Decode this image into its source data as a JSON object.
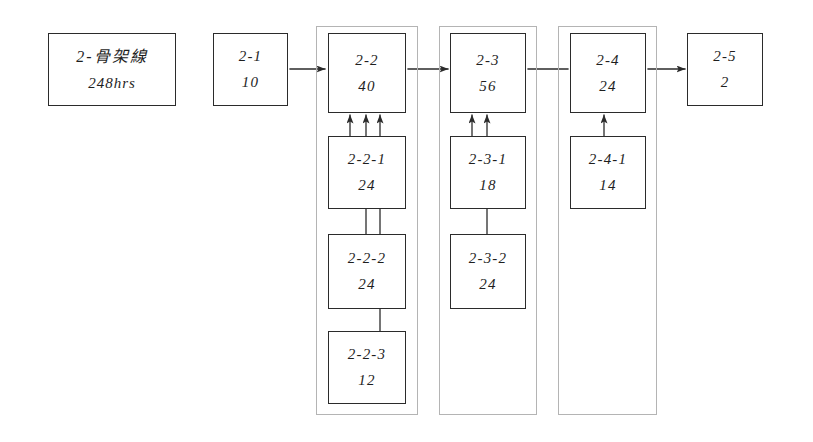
{
  "diagram": {
    "title_node": {
      "line1": "2-骨架線",
      "line2": "248hrs"
    },
    "nodes": [
      {
        "id": "2-1",
        "line1": "2-1",
        "line2": "10",
        "x": 213,
        "y": 33,
        "w": 75,
        "h": 73
      },
      {
        "id": "2-2",
        "line1": "2-2",
        "line2": "40",
        "x": 328,
        "y": 33,
        "w": 78,
        "h": 80
      },
      {
        "id": "2-2-1",
        "line1": "2-2-1",
        "line2": "24",
        "x": 328,
        "y": 136,
        "w": 78,
        "h": 73
      },
      {
        "id": "2-2-2",
        "line1": "2-2-2",
        "line2": "24",
        "x": 328,
        "y": 234,
        "w": 78,
        "h": 75
      },
      {
        "id": "2-2-3",
        "line1": "2-2-3",
        "line2": "12",
        "x": 328,
        "y": 331,
        "w": 78,
        "h": 73
      },
      {
        "id": "2-3",
        "line1": "2-3",
        "line2": "56",
        "x": 450,
        "y": 33,
        "w": 76,
        "h": 80
      },
      {
        "id": "2-3-1",
        "line1": "2-3-1",
        "line2": "18",
        "x": 450,
        "y": 136,
        "w": 76,
        "h": 73
      },
      {
        "id": "2-3-2",
        "line1": "2-3-2",
        "line2": "24",
        "x": 450,
        "y": 234,
        "w": 76,
        "h": 75
      },
      {
        "id": "2-4",
        "line1": "2-4",
        "line2": "24",
        "x": 570,
        "y": 33,
        "w": 76,
        "h": 80
      },
      {
        "id": "2-4-1",
        "line1": "2-4-1",
        "line2": "14",
        "x": 570,
        "y": 136,
        "w": 76,
        "h": 73
      },
      {
        "id": "2-5",
        "line1": "2-5",
        "line2": "2",
        "x": 687,
        "y": 33,
        "w": 76,
        "h": 73
      }
    ],
    "root_node": {
      "x": 48,
      "y": 33,
      "w": 128,
      "h": 73
    },
    "groups": [
      {
        "id": "group-2-2",
        "x": 316,
        "y": 26,
        "w": 102,
        "h": 389
      },
      {
        "id": "group-2-3",
        "x": 439,
        "y": 26,
        "w": 98,
        "h": 389
      },
      {
        "id": "group-2-4",
        "x": 558,
        "y": 26,
        "w": 99,
        "h": 389
      }
    ],
    "flow_arrows": [
      {
        "id": "arrow-2-1-to-2-2",
        "x1": 290,
        "y1": 69,
        "x2": 325,
        "y2": 69,
        "head": true
      },
      {
        "id": "arrow-2-2-to-2-3",
        "x1": 408,
        "y1": 69,
        "x2": 448,
        "y2": 69,
        "head": true
      },
      {
        "id": "arrow-2-3-to-2-4",
        "x1": 528,
        "y1": 69,
        "x2": 568,
        "y2": 69,
        "head": false
      },
      {
        "id": "arrow-2-4-to-2-5",
        "x1": 648,
        "y1": 69,
        "x2": 685,
        "y2": 69,
        "head": true
      }
    ],
    "feed_arrows": [
      {
        "id": "arrow-2-2-1-to-2-2",
        "x": 350,
        "y_from": 136,
        "y_to": 115
      },
      {
        "id": "arrow-2-2-2-to-2-2",
        "x": 366,
        "y_from": 234,
        "y_to": 115
      },
      {
        "id": "arrow-2-2-3-to-2-2",
        "x": 380,
        "y_from": 331,
        "y_to": 115
      },
      {
        "id": "arrow-2-3-1-to-2-3",
        "x": 472,
        "y_from": 136,
        "y_to": 115
      },
      {
        "id": "arrow-2-3-2-to-2-3",
        "x": 487,
        "y_from": 234,
        "y_to": 115
      },
      {
        "id": "arrow-2-4-1-to-2-4",
        "x": 604,
        "y_from": 136,
        "y_to": 115
      }
    ],
    "stroke_color": "#2b2b2b",
    "group_color": "#b4b4b4",
    "background": "#ffffff"
  }
}
